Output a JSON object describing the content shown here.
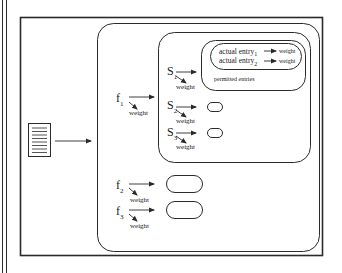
{
  "diagram": {
    "input": {
      "icon": "document-icon"
    },
    "features": [
      {
        "symbol": "f",
        "index": "1",
        "weight_label": "weight"
      },
      {
        "symbol": "f",
        "index": "2",
        "weight_label": "weight"
      },
      {
        "symbol": "f",
        "index": "3",
        "weight_label": "weight"
      }
    ],
    "slots": [
      {
        "symbol": "S",
        "index": "1",
        "weight_label": "weight"
      },
      {
        "symbol": "S",
        "index": "2",
        "weight_label": "weight"
      },
      {
        "symbol": "S",
        "index": "3",
        "weight_label": "weight"
      }
    ],
    "permitted_entries": {
      "label": "permitted entries",
      "entries": [
        {
          "text": "actual entry",
          "index": "1",
          "weight_label": "weight"
        },
        {
          "text": "actual entry",
          "index": "2",
          "weight_label": "weight"
        }
      ]
    },
    "colors": {
      "line": "#2a2a2a",
      "background": "#ffffff"
    }
  }
}
